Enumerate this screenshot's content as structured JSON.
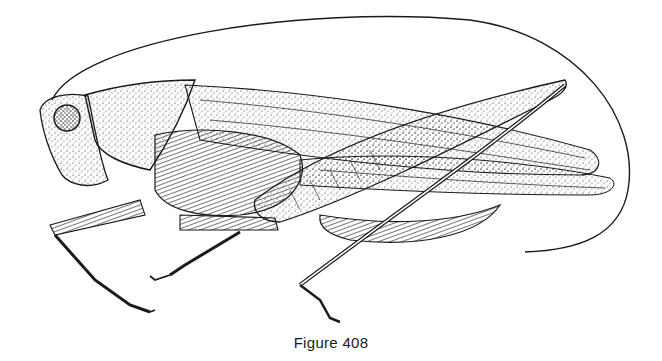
{
  "figure": {
    "illustration": "katydid-stipple-drawing",
    "caption": "Figure 408",
    "ink_color": "#1a1a1a",
    "background": "#ffffff"
  }
}
